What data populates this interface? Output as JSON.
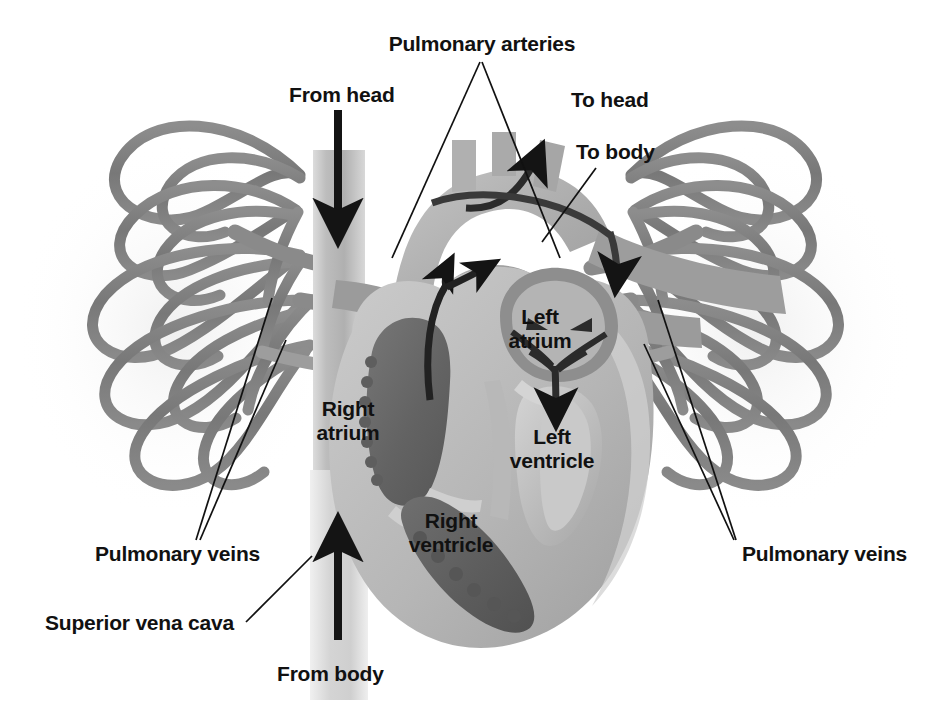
{
  "figure": {
    "type": "anatomical-diagram",
    "background_color": "#ffffff",
    "label_color": "#111111",
    "palette": {
      "myocardium_light": "#bcbcbc",
      "myocardium_mid": "#a7a7a7",
      "chamber_dark": "#6a6a6a",
      "chamber_darker": "#5a5a5a",
      "vessel_gray": "#7a7a7a",
      "vessel_light": "#c6c6c6",
      "vessel_mid": "#9a9a9a",
      "arrow_black": "#141414",
      "leader_line": "#111111"
    }
  },
  "labels": {
    "pulmonary_arteries": "Pulmonary arteries",
    "from_head": "From head",
    "to_head": "To head",
    "to_body": "To body",
    "left_atrium_line1": "Left",
    "left_atrium_line2": "atrium",
    "right_atrium_line1": "Right",
    "right_atrium_line2": "atrium",
    "left_ventricle_line1": "Left",
    "left_ventricle_line2": "ventricle",
    "right_ventricle_line1": "Right",
    "right_ventricle_line2": "ventricle",
    "pulmonary_veins_left": "Pulmonary veins",
    "pulmonary_veins_right": "Pulmonary veins",
    "superior_vena_cava": "Superior vena cava",
    "from_body": "From body"
  },
  "flow_arrows": [
    {
      "name": "from-head-arrow",
      "label": "From head",
      "direction": "down",
      "description": "blood entering superior vena cava from head"
    },
    {
      "name": "from-body-arrow",
      "label": "From body",
      "direction": "up",
      "description": "blood entering inferior vena cava from body"
    },
    {
      "name": "to-head-arrow",
      "label": "To head",
      "direction": "up-right",
      "description": "oxygenated blood leaving aortic arch toward head"
    },
    {
      "name": "to-body-arrow",
      "label": "To body",
      "direction": "down-right",
      "description": "oxygenated blood leaving descending aorta toward body"
    },
    {
      "name": "right-ventricle-outflow-arrow",
      "direction": "up-branching",
      "description": "deoxygenated blood from right ventricle into pulmonary trunk, branching left and right"
    },
    {
      "name": "left-atrium-inflow-arrow",
      "direction": "converging-down",
      "description": "oxygenated blood from pulmonary veins converging in left atrium into left ventricle"
    }
  ],
  "structures": [
    "Right atrium",
    "Right ventricle",
    "Left atrium",
    "Left ventricle",
    "Superior vena cava",
    "Inferior vena cava",
    "Aortic arch",
    "Pulmonary arteries",
    "Pulmonary veins",
    "Lung vasculature (left)",
    "Lung vasculature (right)"
  ]
}
